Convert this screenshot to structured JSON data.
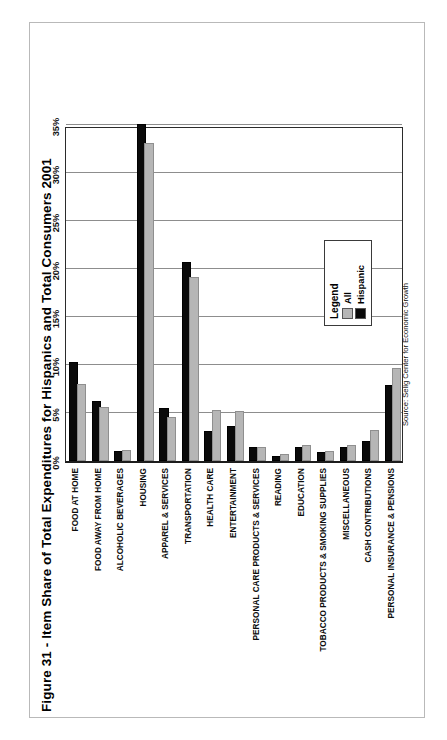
{
  "figure": {
    "title": "Figure 31 - Item Share of Total Expenditures for Hispanics and Total Consumers  2001",
    "source": "Source: Selig Center for Economic Growth"
  },
  "legend": {
    "title": "Legend",
    "items": [
      {
        "label": "All",
        "color": "#b6b6b6"
      },
      {
        "label": "Hispanic",
        "color": "#0a0a0a"
      }
    ]
  },
  "chart_data": {
    "type": "bar",
    "orientation": "horizontal",
    "title": "Figure 31 - Item Share of Total Expenditures for Hispanics and Total Consumers  2001",
    "xlabel": "",
    "ylabel": "",
    "xlim": [
      0,
      35
    ],
    "xtick_labels": [
      "0%",
      "5%",
      "10%",
      "15%",
      "20%",
      "25%",
      "30%",
      "35%"
    ],
    "xticks": [
      0,
      5,
      10,
      15,
      20,
      25,
      30,
      35
    ],
    "grid": true,
    "legend_position": "bottom-right",
    "value_unit": "percent",
    "categories": [
      "FOOD AT HOME",
      "FOOD AWAY FROM HOME",
      "ALCOHOLIC BEVERAGES",
      "HOUSING",
      "APPAREL & SERVICES",
      "TRANSPORTATION",
      "HEALTH CARE",
      "ENTERTAINMENT",
      "PERSONAL CARE PRODUCTS & SERVICES",
      "READING",
      "EDUCATION",
      "TOBACCO PRODUCTS & SMOKING SUPPLIES",
      "MISCELLANEOUS",
      "CASH CONTRIBUTIONS",
      "PERSONAL INSURANCE & PENSIONS"
    ],
    "series": [
      {
        "name": "Hispanic",
        "color": "#0a0a0a",
        "values": [
          10.1,
          6.0,
          0.8,
          34.9,
          5.3,
          20.5,
          2.9,
          3.4,
          1.3,
          0.3,
          1.2,
          0.7,
          1.2,
          1.9,
          7.7
        ]
      },
      {
        "name": "All",
        "color": "#b6b6b6",
        "values": [
          7.8,
          5.4,
          0.9,
          32.9,
          4.4,
          19.0,
          5.1,
          5.0,
          1.3,
          0.5,
          1.5,
          0.8,
          1.5,
          3.0,
          9.5
        ]
      }
    ]
  }
}
